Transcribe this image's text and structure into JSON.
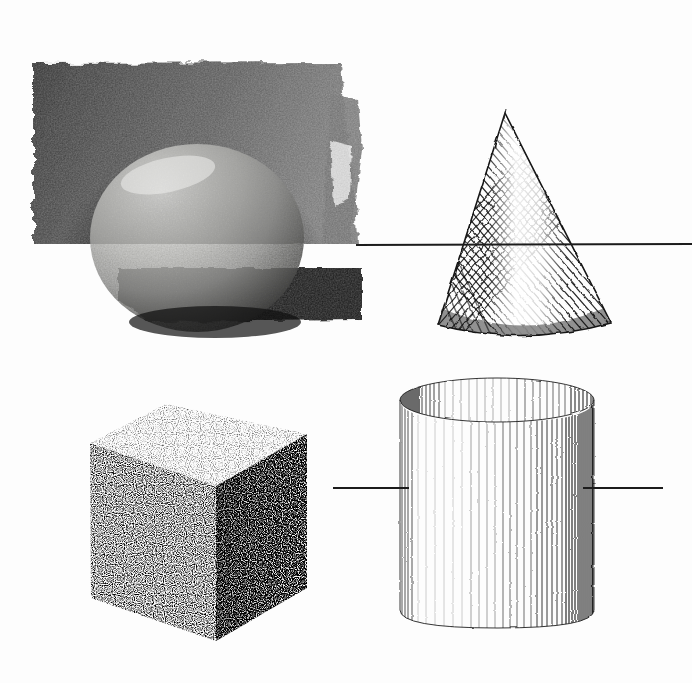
{
  "page": {
    "background_color": "#fdfdfd",
    "width": 692,
    "height": 683,
    "medium": "grayscale drawing / scanned plate",
    "caption_text": ""
  },
  "figures": [
    {
      "id": "sphere-panel",
      "name": "sphere",
      "label": "Sphere rendered in smudged charcoal / wash with dark background panel",
      "technique": "tonal wash",
      "bbox": [
        32,
        60,
        362,
        340
      ],
      "colors": {
        "panel_dark": "#3f3f3f",
        "panel_darkest": "#1b1b1b",
        "sphere_light": "#d8d8d6",
        "sphere_mid": "#a9a9a7",
        "sphere_shadow": "#4a4a4a",
        "ground_shadow": "#141414"
      },
      "highlight_position": "upper-left",
      "sphere_bbox": [
        90,
        144,
        305,
        332
      ]
    },
    {
      "id": "cone-figure",
      "name": "cone",
      "label": "Cone rendered with diagonal cross-hatching",
      "technique": "diagonal hatching",
      "bbox": [
        435,
        112,
        612,
        340
      ],
      "colors": {
        "stroke": "#1d1d1d",
        "light_core": "#e9e9e9",
        "dark_side": "#242424"
      },
      "apex": [
        505,
        114
      ],
      "base_left": [
        437,
        326
      ],
      "base_right": [
        610,
        322
      ],
      "highlight_position": "center-left / vertical light band"
    },
    {
      "id": "cube-figure",
      "name": "cube",
      "label": "Cube rendered with stippled dot texture",
      "technique": "stipple / dot shading",
      "bbox": [
        88,
        402,
        308,
        643
      ],
      "colors": {
        "top_face": "#e4e4e4",
        "left_face": "#b4b4b4",
        "right_face": "#7e7e7e",
        "dot": "#111111"
      },
      "top_face_tone": "lightest",
      "left_face_tone": "mid",
      "right_face_tone": "darkest",
      "vertices": {
        "top_back": [
          166,
          404
        ],
        "top_left": [
          90,
          443
        ],
        "top_right": [
          306,
          434
        ],
        "top_front": [
          215,
          486
        ],
        "bottom_left": [
          91,
          598
        ],
        "bottom_front": [
          216,
          641
        ],
        "bottom_right": [
          306,
          588
        ]
      }
    },
    {
      "id": "cylinder-figure",
      "name": "cylinder",
      "label": "Cylinder rendered with vertical line hatching",
      "technique": "vertical line hatching",
      "bbox": [
        398,
        380,
        615,
        632
      ],
      "colors": {
        "stroke": "#222222",
        "light_core": "#fbfbfb",
        "dark_edge": "#1a1a1a"
      },
      "top_ellipse_center": [
        497,
        400
      ],
      "top_ellipse_rx": 97,
      "top_ellipse_ry": 22,
      "bottom_y": 624,
      "highlight_position": "left-of-center"
    }
  ],
  "horizon_lines": [
    {
      "id": "upper-horizon-line",
      "name": "upper horizon rule",
      "x1": 356,
      "y1": 245,
      "x2": 692,
      "y2": 244,
      "color": "#1c1c1c",
      "thickness": 2
    },
    {
      "id": "lower-horizon-line-left",
      "name": "lower horizon rule (left segment)",
      "x1": 333,
      "y1": 488,
      "x2": 409,
      "y2": 488,
      "color": "#1c1c1c",
      "thickness": 2
    },
    {
      "id": "lower-horizon-line-right",
      "name": "lower horizon rule (right segment)",
      "x1": 583,
      "y1": 488,
      "x2": 663,
      "y2": 488,
      "color": "#1c1c1c",
      "thickness": 2
    }
  ]
}
